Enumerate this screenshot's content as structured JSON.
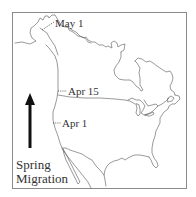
{
  "map": {
    "title": "Spring Migration",
    "region": "North America",
    "colors": {
      "outline": "#555555",
      "frame": "#8a8a8a",
      "text": "#333333",
      "arrow": "#111111",
      "background": "#ffffff"
    },
    "date_markers": [
      {
        "label": "May 1",
        "x": 55,
        "y": 18
      },
      {
        "label": "Apr 15",
        "x": 68,
        "y": 87
      },
      {
        "label": "Apr 1",
        "x": 62,
        "y": 119
      }
    ],
    "legend": {
      "arrow_icon": "up-arrow-icon",
      "line1": "Spring",
      "line2": "Migration"
    }
  }
}
